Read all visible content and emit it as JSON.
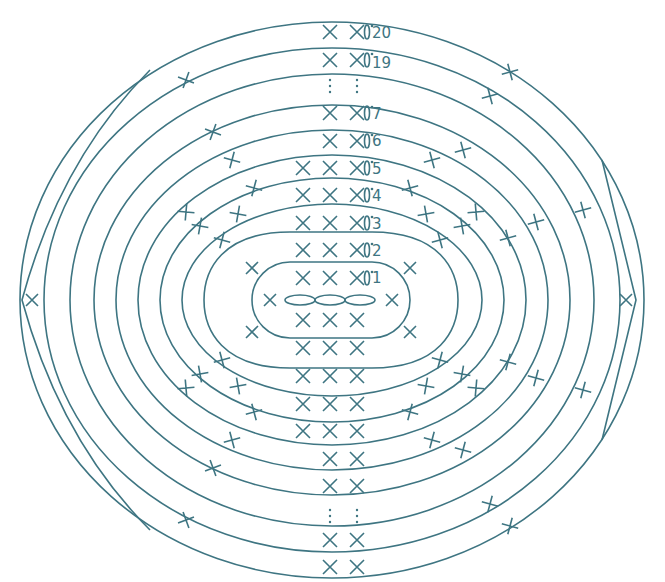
{
  "diagram": {
    "stroke_color": "#3e7582",
    "background": "#ffffff",
    "symbols": {
      "single_crochet": "×",
      "chain": "oval loop",
      "round_end_marker": "0̇",
      "continuation": "⋮"
    },
    "foundation_chain_count": 3,
    "round_labels": [
      {
        "round": 1,
        "label": "1"
      },
      {
        "round": 2,
        "label": "2"
      },
      {
        "round": 3,
        "label": "3"
      },
      {
        "round": 4,
        "label": "4"
      },
      {
        "round": 5,
        "label": "5"
      },
      {
        "round": 6,
        "label": "6"
      },
      {
        "round": 7,
        "label": "7"
      },
      {
        "round": 19,
        "label": "19"
      },
      {
        "round": 20,
        "label": "20"
      }
    ],
    "top_column_rows": [
      {
        "round": 20,
        "stitches": 2
      },
      {
        "round": 19,
        "stitches": 2
      },
      {
        "round": 7,
        "stitches": 2
      },
      {
        "round": 6,
        "stitches": 2
      },
      {
        "round": 5,
        "stitches": 3
      },
      {
        "round": 4,
        "stitches": 3
      },
      {
        "round": 3,
        "stitches": 3
      },
      {
        "round": 2,
        "stitches": 3
      },
      {
        "round": 1,
        "stitches": 3
      }
    ],
    "bottom_column_rows": [
      {
        "round": 1,
        "stitches": 3
      },
      {
        "round": 2,
        "stitches": 3
      },
      {
        "round": 3,
        "stitches": 3
      },
      {
        "round": 4,
        "stitches": 3
      },
      {
        "round": 5,
        "stitches": 3
      },
      {
        "round": 6,
        "stitches": 2
      },
      {
        "round": 7,
        "stitches": 2
      },
      {
        "round": 19,
        "stitches": 2
      },
      {
        "round": 20,
        "stitches": 2
      }
    ],
    "side_marks": {
      "left": "×",
      "right": "×"
    }
  }
}
